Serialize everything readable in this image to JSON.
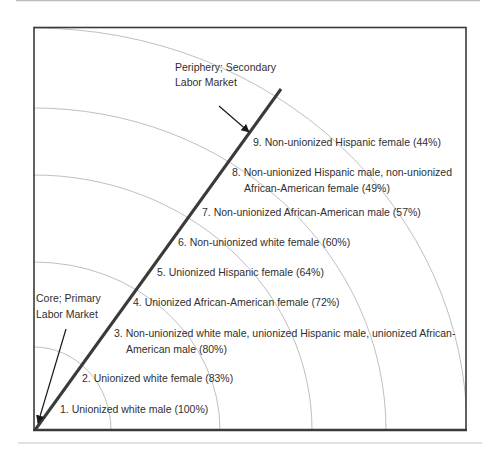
{
  "diagram": {
    "type": "concentric-quarter-rings",
    "colors": {
      "frame": "#3a3a3a",
      "arcs": "#b8b8b8",
      "divider_line": "#3a3a3a",
      "rules": "#bdbdbd",
      "text": "#2f2f2f"
    },
    "annotations": {
      "periphery": {
        "line1": "Periphery; Secondary",
        "line2": "Labor Market"
      },
      "core": {
        "line1": "Core; Primary",
        "line2": "Labor Market"
      }
    },
    "rings": [
      {
        "rank": 1,
        "line1": "1. Unionized white male (100%)",
        "line2": "",
        "group": "Unionized white male",
        "percent": 100
      },
      {
        "rank": 2,
        "line1": "2. Unionized white female (83%)",
        "line2": "",
        "group": "Unionized white female",
        "percent": 83
      },
      {
        "rank": 3,
        "line1": "3. Non-unionized white male, unionized Hispanic male, unionized African-",
        "line2": "American male (80%)",
        "group": "Non-unionized white male, unionized Hispanic male, unionized African-American male",
        "percent": 80
      },
      {
        "rank": 4,
        "line1": "4. Unionized African-American female (72%)",
        "line2": "",
        "group": "Unionized African-American female",
        "percent": 72
      },
      {
        "rank": 5,
        "line1": "5. Unionized Hispanic female (64%)",
        "line2": "",
        "group": "Unionized Hispanic female",
        "percent": 64
      },
      {
        "rank": 6,
        "line1": "6. Non-unionized white female (60%)",
        "line2": "",
        "group": "Non-unionized white female",
        "percent": 60
      },
      {
        "rank": 7,
        "line1": "7. Non-unionized African-American male (57%)",
        "line2": "",
        "group": "Non-unionized African-American male",
        "percent": 57
      },
      {
        "rank": 8,
        "line1": "8. Non-unionized Hispanic male, non-unionized",
        "line2": "African-American female (49%)",
        "group": "Non-unionized Hispanic male, non-unionized African-American female",
        "percent": 49
      },
      {
        "rank": 9,
        "line1": "9. Non-unionized Hispanic female (44%)",
        "line2": "",
        "group": "Non-unionized Hispanic female",
        "percent": 44
      }
    ]
  }
}
